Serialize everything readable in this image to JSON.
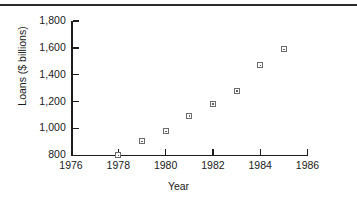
{
  "figure": {
    "has_top_rule": true,
    "background_color": "#ffffff",
    "axis_color": "#1d1d1d",
    "marker_color": "#6b6b6b"
  },
  "chart_data": {
    "type": "scatter",
    "title": "",
    "xlabel": "Year",
    "ylabel": "Loans ($ billions)",
    "xlim": [
      1976,
      1986
    ],
    "ylim": [
      800,
      1800
    ],
    "grid": false,
    "legend": false,
    "x": [
      1978,
      1979,
      1980,
      1981,
      1982,
      1983,
      1984,
      1985
    ],
    "values": [
      800,
      905,
      980,
      1095,
      1185,
      1280,
      1470,
      1590
    ],
    "xticks": [
      1976,
      1978,
      1980,
      1982,
      1984,
      1986
    ],
    "xticklabels": [
      "1976",
      "1978",
      "1980",
      "1982",
      "1984",
      "1986"
    ],
    "yticks": [
      800,
      1000,
      1200,
      1400,
      1600,
      1800
    ],
    "yticklabels": [
      "800",
      "1,000",
      "1,200",
      "1,400",
      "1,600",
      "1,800"
    ],
    "marker_style": "open-square-with-dot"
  }
}
